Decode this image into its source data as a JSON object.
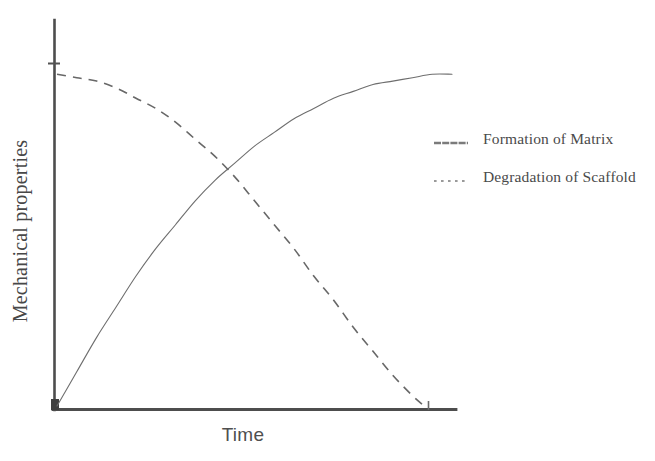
{
  "figure": {
    "background_color": "#ffffff",
    "ink_color": "#5a5a5a"
  },
  "chart_data": {
    "type": "line",
    "title": "",
    "subtitle": "",
    "xlabel": "Time",
    "ylabel": "Mechanical properties",
    "xlim": [
      0,
      100
    ],
    "ylim": [
      0,
      100
    ],
    "grid": false,
    "xticks": [],
    "yticks": [],
    "xticklabels": [],
    "yticklabels": [],
    "legend_position": "right",
    "annotations": [],
    "series": [
      {
        "name": "Formation of Matrix",
        "linestyle": "solid",
        "color": "#6e6e6e",
        "linewidth": 1.1,
        "x": [
          0,
          5,
          10,
          15,
          20,
          25,
          30,
          35,
          40,
          45,
          50,
          55,
          60,
          65,
          70,
          75,
          80,
          85,
          90,
          95,
          100
        ],
        "y": [
          0,
          10,
          20,
          29,
          38,
          46,
          53,
          60,
          66,
          71,
          76,
          80,
          84,
          87,
          90,
          92,
          94,
          95,
          96,
          97,
          97
        ]
      },
      {
        "name": "Degradation of Scaffold",
        "linestyle": "dashed",
        "color": "#676767",
        "linewidth": 1.6,
        "x": [
          0,
          5,
          10,
          15,
          20,
          25,
          30,
          35,
          40,
          45,
          50,
          55,
          60,
          65,
          70,
          75,
          80,
          85,
          90,
          93
        ],
        "y": [
          97,
          96,
          95,
          93,
          90,
          87,
          83,
          78,
          73,
          67,
          60,
          53,
          46,
          38,
          31,
          23,
          16,
          9,
          3,
          0
        ]
      }
    ]
  },
  "axes": {
    "y_axis": {
      "name": "y-axis-line"
    },
    "x_axis": {
      "name": "x-axis-line"
    },
    "origin_marker": "origin-tick",
    "y_start_tick": "y-axis-start-tick"
  },
  "legend": {
    "entries": [
      {
        "label": "Formation of Matrix",
        "style": "solid",
        "color": "#6e6e6e"
      },
      {
        "label": "Degradation of Scaffold",
        "style": "dotted",
        "color": "#8a8a8a"
      }
    ]
  }
}
